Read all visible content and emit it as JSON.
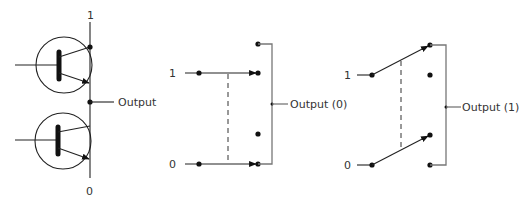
{
  "diagram": {
    "colors": {
      "line": "#222222",
      "rail": "#777777",
      "dot": "#111111",
      "text": "#333333"
    },
    "transistor_pair": {
      "top_label": "1",
      "bottom_label": "0",
      "output_label": "Output"
    },
    "switch_output_0": {
      "input_1_label": "1",
      "input_0_label": "0",
      "output_label": "Output (0)"
    },
    "switch_output_1": {
      "input_1_label": "1",
      "input_0_label": "0",
      "output_label": "Output (1)"
    }
  }
}
